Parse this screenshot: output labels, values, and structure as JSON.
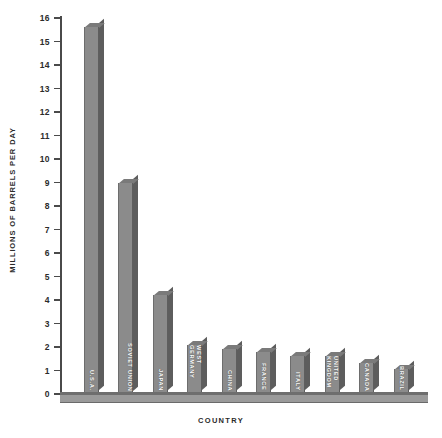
{
  "chart_data": {
    "type": "bar",
    "title": "",
    "xlabel": "COUNTRY",
    "ylabel": "MILLIONS OF BARRELS PER DAY",
    "ylim": [
      0,
      16
    ],
    "ytick_labels": [
      "16",
      "15",
      "14",
      "13",
      "12",
      "11",
      "10",
      "9",
      "8",
      "7",
      "6",
      "5",
      "4",
      "3",
      "2",
      "1",
      "0"
    ],
    "yticks": [
      16,
      15,
      14,
      13,
      12,
      11,
      10,
      9,
      8,
      7,
      6,
      5,
      4,
      3,
      2,
      1,
      0
    ],
    "grid": false,
    "legend": "none",
    "categories": [
      "U.S.A.",
      "SOVIET UNION",
      "JAPAN",
      "WEST GERMANY",
      "CHINA",
      "FRANCE",
      "ITALY",
      "UNITED KINGDOM",
      "CANADA",
      "BRAZIL"
    ],
    "values": [
      15.6,
      9.0,
      4.2,
      2.1,
      1.9,
      1.8,
      1.6,
      1.6,
      1.3,
      1.05
    ],
    "bar_color": "#8b8b8b",
    "bar_side_color": "#5d5d5d",
    "bar_top_color": "#7a7a7a",
    "axis_color": "#4a4a4a",
    "background_color": "#ffffff"
  }
}
